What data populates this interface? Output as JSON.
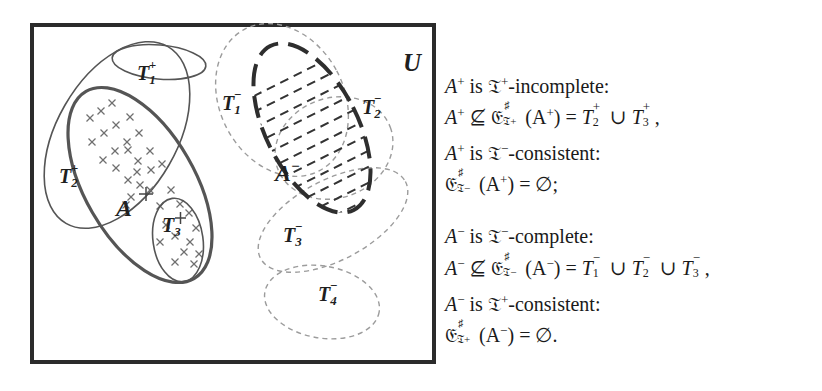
{
  "figure": {
    "universe_label": "U",
    "colors": {
      "frame": "#2b2b2b",
      "positive_outline": "#555555",
      "negative_outline": "#9a9a9a",
      "A_minus_outline": "#2e2e2e",
      "cross_marks": "#666666",
      "text": "#1a1a1a"
    },
    "regions": [
      {
        "id": "T1+",
        "base": "T",
        "sub": "1",
        "sup": "+",
        "style": "solid-thin",
        "kind": "positive-theory"
      },
      {
        "id": "T2+",
        "base": "T",
        "sub": "2",
        "sup": "+",
        "style": "solid-thin",
        "kind": "positive-theory"
      },
      {
        "id": "T3+",
        "base": "T",
        "sub": "3",
        "sup": "+",
        "style": "solid-thin",
        "kind": "positive-theory"
      },
      {
        "id": "A+",
        "base": "A",
        "sup": "+",
        "style": "solid-thick",
        "kind": "positive-examples",
        "fill": "crosses"
      },
      {
        "id": "A-",
        "base": "A",
        "sup": "−",
        "style": "dashed-thick",
        "kind": "negative-examples",
        "fill": "dashes"
      },
      {
        "id": "T1-",
        "base": "T",
        "sub": "1",
        "sup": "−",
        "style": "dashed-thin",
        "kind": "negative-theory"
      },
      {
        "id": "T2-",
        "base": "T",
        "sub": "2",
        "sup": "−",
        "style": "dashed-thin",
        "kind": "negative-theory"
      },
      {
        "id": "T3-",
        "base": "T",
        "sub": "3",
        "sup": "−",
        "style": "dashed-thin",
        "kind": "negative-theory"
      },
      {
        "id": "T4-",
        "base": "T",
        "sub": "4",
        "sup": "−",
        "style": "dashed-thin",
        "kind": "negative-theory"
      }
    ]
  },
  "statements": {
    "positive": {
      "line1": {
        "subject": "A",
        "subject_sup": "+",
        "is": " is ",
        "frak": "𝔗",
        "frak_sup": "+",
        "property": "-incomplete:"
      },
      "line2": {
        "lhs": "A",
        "lhs_sup": "+",
        "rel": " ⊈ ",
        "op": "𝔈",
        "op_sup": "♯",
        "op_sub_base": "𝔗",
        "op_sub_sign": "+",
        "arg": "(A",
        "arg_sup": "+",
        "arg_close": ")",
        "eq": " = ",
        "rhs": "T₂⁺ ∪ T₃⁺,",
        "rhs_terms": [
          {
            "base": "T",
            "sub": "2",
            "sup": "+"
          },
          {
            "base": "T",
            "sub": "3",
            "sup": "+"
          }
        ],
        "union": " ∪ ",
        "end": ","
      },
      "line3": {
        "subject": "A",
        "subject_sup": "+",
        "is": " is ",
        "frak": "𝔗",
        "frak_sup": "−",
        "property": "-consistent:"
      },
      "line4": {
        "op": "𝔈",
        "op_sup": "♯",
        "op_sub_base": "𝔗",
        "op_sub_sign": "−",
        "arg": "(A",
        "arg_sup": "+",
        "arg_close": ")",
        "eq": " = ",
        "rhs": "∅;"
      }
    },
    "negative": {
      "line1": {
        "subject": "A",
        "subject_sup": "−",
        "is": " is ",
        "frak": "𝔗",
        "frak_sup": "−",
        "property": "-complete:"
      },
      "line2": {
        "lhs": "A",
        "lhs_sup": "−",
        "rel": " ⊈ ",
        "op": "𝔈",
        "op_sup": "♯",
        "op_sub_base": "𝔗",
        "op_sub_sign": "−",
        "arg": "(A",
        "arg_sup": "−",
        "arg_close": ")",
        "eq": " = ",
        "rhs": "T₁⁻ ∪ T₂⁻ ∪ T₃⁻,",
        "rhs_terms": [
          {
            "base": "T",
            "sub": "1",
            "sup": "−"
          },
          {
            "base": "T",
            "sub": "2",
            "sup": "−"
          },
          {
            "base": "T",
            "sub": "3",
            "sup": "−"
          }
        ],
        "union": " ∪ ",
        "end": ","
      },
      "line3": {
        "subject": "A",
        "subject_sup": "−",
        "is": " is ",
        "frak": "𝔗",
        "frak_sup": "+",
        "property": "-consistent:"
      },
      "line4": {
        "op": "𝔈",
        "op_sup": "♯",
        "op_sub_base": "𝔗",
        "op_sub_sign": "+",
        "arg": "(A",
        "arg_sup": "−",
        "arg_close": ")",
        "eq": " = ",
        "rhs": "∅."
      }
    }
  }
}
